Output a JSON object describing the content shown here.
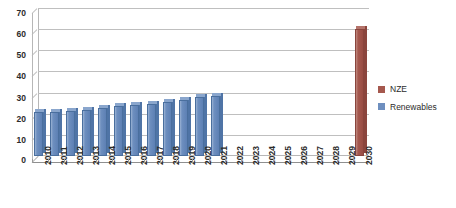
{
  "chart_data": {
    "type": "bar",
    "title": "",
    "subtitle": "",
    "xlabel": "",
    "ylabel": "",
    "ylim": [
      0,
      70
    ],
    "ytick_step": 10,
    "yticks": [
      0,
      10,
      20,
      30,
      40,
      50,
      60,
      70
    ],
    "grid": true,
    "legend_position": "right",
    "style": "3d-column",
    "categories": [
      "2010",
      "2011",
      "2012",
      "2013",
      "2014",
      "2015",
      "2016",
      "2017",
      "2018",
      "2019",
      "2020",
      "2021",
      "2022",
      "2023",
      "2024",
      "2025",
      "2026",
      "2027",
      "2028",
      "2029",
      "2030"
    ],
    "series": [
      {
        "name": "Renewables",
        "color": "#6e8fbf",
        "values": [
          21,
          21,
          21.5,
          22,
          22.5,
          23.5,
          24,
          24.5,
          25.5,
          26.5,
          28,
          28.5,
          null,
          null,
          null,
          null,
          null,
          null,
          null,
          null,
          null
        ]
      },
      {
        "name": "NZE",
        "color": "#a5584e",
        "values": [
          null,
          null,
          null,
          null,
          null,
          null,
          null,
          null,
          null,
          null,
          null,
          null,
          null,
          null,
          null,
          null,
          null,
          null,
          null,
          null,
          60
        ]
      }
    ]
  },
  "legend": {
    "items": [
      {
        "label": "NZE",
        "color": "#a5584e"
      },
      {
        "label": "Renewables",
        "color": "#6e8fbf"
      }
    ]
  }
}
